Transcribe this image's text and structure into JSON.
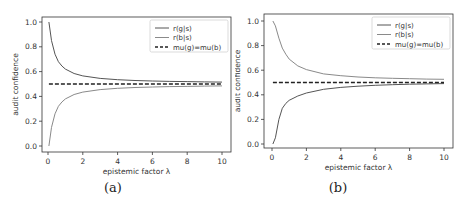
{
  "figure": {
    "panels": [
      {
        "caption": "(a)",
        "legend": [
          "r(g|s)",
          "r(b|s)",
          "mu(g)=mu(b)"
        ]
      },
      {
        "caption": "(b)",
        "legend": [
          "r(g|s)",
          "r(b|s)",
          "mu(g)=mu(b)"
        ]
      }
    ]
  },
  "chart_data": [
    {
      "type": "line",
      "title": "",
      "caption": "(a)",
      "xlabel": "epistemic factor λ",
      "ylabel": "audit confidence",
      "xlim": [
        -0.4,
        10.4
      ],
      "ylim": [
        -0.03,
        1.05
      ],
      "xticks": [
        0,
        2,
        4,
        6,
        8,
        10
      ],
      "yticks": [
        0.0,
        0.2,
        0.4,
        0.6,
        0.8,
        1.0
      ],
      "grid": false,
      "legend_position": "upper right",
      "x": [
        0.05,
        0.2,
        0.4,
        0.6,
        0.8,
        1.0,
        1.5,
        2,
        3,
        4,
        5,
        6,
        7,
        8,
        9,
        10
      ],
      "series": [
        {
          "name": "r(g|s)",
          "color": "#555555",
          "style": "solid",
          "values": [
            1.0,
            0.85,
            0.74,
            0.68,
            0.645,
            0.62,
            0.585,
            0.565,
            0.545,
            0.535,
            0.528,
            0.524,
            0.521,
            0.519,
            0.517,
            0.515
          ]
        },
        {
          "name": "r(b|s)",
          "color": "#8a8a8a",
          "style": "solid",
          "values": [
            0.0,
            0.15,
            0.26,
            0.32,
            0.355,
            0.38,
            0.415,
            0.435,
            0.455,
            0.465,
            0.472,
            0.476,
            0.479,
            0.481,
            0.483,
            0.485
          ]
        },
        {
          "name": "mu(g)=mu(b)",
          "color": "#222222",
          "style": "dashed",
          "values": [
            0.5,
            0.5,
            0.5,
            0.5,
            0.5,
            0.5,
            0.5,
            0.5,
            0.5,
            0.5,
            0.5,
            0.5,
            0.5,
            0.5,
            0.5,
            0.5
          ]
        }
      ]
    },
    {
      "type": "line",
      "title": "",
      "caption": "(b)",
      "xlabel": "epistemic factor λ",
      "ylabel": "audit confidence",
      "xlim": [
        -0.4,
        10.4
      ],
      "ylim": [
        -0.03,
        1.05
      ],
      "xticks": [
        0,
        2,
        4,
        6,
        8,
        10
      ],
      "yticks": [
        0.0,
        0.2,
        0.4,
        0.6,
        0.8,
        1.0
      ],
      "grid": false,
      "legend_position": "upper right",
      "x": [
        0.05,
        0.2,
        0.4,
        0.6,
        0.8,
        1.0,
        1.5,
        2,
        3,
        4,
        5,
        6,
        7,
        8,
        9,
        10
      ],
      "series": [
        {
          "name": "r(g|s)",
          "color": "#555555",
          "style": "solid",
          "values": [
            0.0,
            0.05,
            0.2,
            0.29,
            0.33,
            0.355,
            0.39,
            0.415,
            0.445,
            0.46,
            0.47,
            0.477,
            0.482,
            0.486,
            0.489,
            0.491
          ]
        },
        {
          "name": "r(b|s)",
          "color": "#8a8a8a",
          "style": "solid",
          "values": [
            1.0,
            0.96,
            0.86,
            0.78,
            0.73,
            0.69,
            0.635,
            0.605,
            0.57,
            0.555,
            0.545,
            0.538,
            0.534,
            0.531,
            0.528,
            0.526
          ]
        },
        {
          "name": "mu(g)=mu(b)",
          "color": "#222222",
          "style": "dashed",
          "values": [
            0.5,
            0.5,
            0.5,
            0.5,
            0.5,
            0.5,
            0.5,
            0.5,
            0.5,
            0.5,
            0.5,
            0.5,
            0.5,
            0.5,
            0.5,
            0.5
          ]
        }
      ]
    }
  ]
}
